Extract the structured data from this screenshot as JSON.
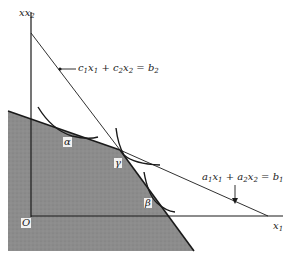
{
  "diagram": {
    "type": "linear-programming-feasible-region",
    "axes": {
      "x_label": "x1",
      "y_label": "x2",
      "origin_label": "O"
    },
    "constraints": [
      {
        "id": "constraint-b1",
        "label": "a1x1 + a2x2 = b1",
        "parts": {
          "a1": "a",
          "s1": "1",
          "x1": "x",
          "s2": "1",
          "plus": "+",
          "a2": "a",
          "s3": "2",
          "x2": "x",
          "s4": "2",
          "eq": "=",
          "b": "b",
          "s5": "1"
        }
      },
      {
        "id": "constraint-b2",
        "label": "c1x1 + c2x2 = b2",
        "parts": {
          "a1": "c",
          "s1": "1",
          "x1": "x",
          "s2": "1",
          "plus": "+",
          "a2": "c",
          "s3": "2",
          "x2": "x",
          "s4": "2",
          "eq": "=",
          "b": "b",
          "s5": "2"
        }
      }
    ],
    "points": [
      {
        "id": "alpha",
        "label": "α"
      },
      {
        "id": "gamma",
        "label": "γ"
      },
      {
        "id": "beta",
        "label": "β"
      }
    ],
    "colors": {
      "shaded_region": "#8a8a8a",
      "lines": "#1a1a1a",
      "background": "#ffffff"
    }
  }
}
